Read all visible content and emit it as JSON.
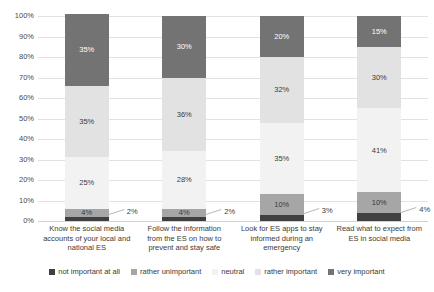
{
  "chart_data": {
    "type": "bar",
    "stacked": true,
    "stack_mode": "percent",
    "title": "",
    "subtitle": "",
    "xlabel": "",
    "ylabel": "",
    "ylim": [
      0,
      100
    ],
    "grid": true,
    "legend_position": "bottom",
    "ytick_labels": [
      "100%",
      "90%",
      "80%",
      "70%",
      "60%",
      "50%",
      "40%",
      "30%",
      "20%",
      "10%",
      "0%"
    ],
    "ytick_values": [
      100,
      90,
      80,
      70,
      60,
      50,
      40,
      30,
      20,
      10,
      0
    ],
    "categories": [
      "Know the social media accounts of your local and national ES",
      "Follow the information from the ES on how to prevent and stay safe",
      "Look for ES apps to stay informed during an emergency",
      "Read what to expect from ES in social media"
    ],
    "category_lines": [
      [
        "Know the social media",
        "accounts of your local and",
        "national ES"
      ],
      [
        "Follow the information",
        "from the ES on how to",
        "prevent and stay safe"
      ],
      [
        "Look for ES apps to stay",
        "informed during an",
        "emergency"
      ],
      [
        "Read what to expect from",
        "ES in social media"
      ]
    ],
    "series": [
      {
        "name": "not important at all",
        "color": "#404040",
        "values": [
          2,
          2,
          3,
          4
        ],
        "labels": [
          "2%",
          "2%",
          "3%",
          "4%"
        ],
        "label_placement": "callout"
      },
      {
        "name": "rather unimportant",
        "color": "#a6a6a6",
        "values": [
          4,
          4,
          10,
          10
        ],
        "labels": [
          "4%",
          "4%",
          "10%",
          "10%"
        ],
        "label_placement": "inside"
      },
      {
        "name": "neutral",
        "color": "#f2f2f2",
        "values": [
          25,
          28,
          35,
          41
        ],
        "labels": [
          "25%",
          "28%",
          "35%",
          "41%"
        ],
        "label_placement": "inside"
      },
      {
        "name": "rather important",
        "color": "#e2e2e2",
        "values": [
          35,
          36,
          32,
          30
        ],
        "labels": [
          "35%",
          "36%",
          "32%",
          "30%"
        ],
        "label_placement": "inside"
      },
      {
        "name": "very important",
        "color": "#737373",
        "values": [
          35,
          30,
          20,
          15
        ],
        "labels": [
          "35%",
          "30%",
          "20%",
          "15%"
        ],
        "label_placement": "inside"
      }
    ]
  }
}
